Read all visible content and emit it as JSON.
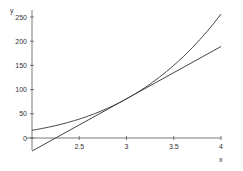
{
  "chart_data": {
    "type": "line",
    "title": "",
    "xlabel": "x",
    "ylabel": "y",
    "xlim": [
      2,
      4
    ],
    "ylim": [
      -25,
      256
    ],
    "grid": false,
    "legend": null,
    "x_ticks": [
      2.5,
      3,
      3.5,
      4
    ],
    "x_tick_labels": [
      "2.5",
      "3",
      "3.5",
      "4"
    ],
    "y_ticks": [
      0,
      50,
      100,
      150,
      200,
      250
    ],
    "y_tick_labels": [
      "0",
      "50",
      "100",
      "150",
      "200",
      "250"
    ],
    "series": [
      {
        "name": "curve y = x^4",
        "x": [
          2,
          2.25,
          2.5,
          2.75,
          3,
          3.25,
          3.5,
          3.75,
          4
        ],
        "values": [
          16,
          25.6,
          39.1,
          57.2,
          81,
          111.6,
          150.1,
          197.8,
          256
        ]
      },
      {
        "name": "tangent line at x = 3",
        "x": [
          2,
          4
        ],
        "values": [
          -27,
          189
        ]
      }
    ],
    "colors": {
      "axis": "#555555",
      "series": "#444444"
    }
  }
}
